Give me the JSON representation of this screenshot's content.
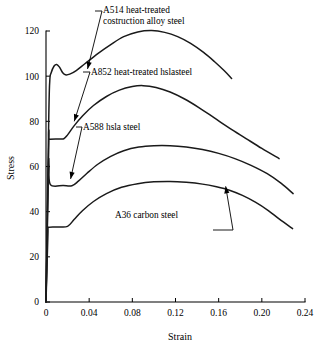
{
  "chart_data": {
    "type": "line",
    "title": "",
    "xlabel": "Strain",
    "ylabel": "Stress",
    "xlim": [
      0,
      0.24
    ],
    "ylim": [
      0,
      120
    ],
    "xticks": [
      "0",
      "0.04",
      "0.08",
      "0.12",
      "0.16",
      "0.20",
      "0.24"
    ],
    "xtick_values": [
      0,
      0.04,
      0.08,
      0.12,
      0.16,
      0.2,
      0.24
    ],
    "yticks": [
      "0",
      "20",
      "40",
      "60",
      "80",
      "100",
      "120"
    ],
    "ytick_values": [
      0,
      20,
      40,
      60,
      80,
      100,
      120
    ],
    "grid": false,
    "legend": "inline-annotations",
    "series": [
      {
        "name": "A514 heat-treated costruction alloy steel",
        "points": [
          [
            0.0,
            0.0
          ],
          [
            0.0025,
            80.0
          ],
          [
            0.0035,
            98.0
          ],
          [
            0.0048,
            101.5
          ],
          [
            0.0075,
            104.5
          ],
          [
            0.01,
            105.2
          ],
          [
            0.0125,
            104.0
          ],
          [
            0.0155,
            101.5
          ],
          [
            0.018,
            100.6
          ],
          [
            0.022,
            100.9
          ],
          [
            0.028,
            102.5
          ],
          [
            0.036,
            105.5
          ],
          [
            0.048,
            110.0
          ],
          [
            0.06,
            114.0
          ],
          [
            0.072,
            117.5
          ],
          [
            0.085,
            119.6
          ],
          [
            0.098,
            120.2
          ],
          [
            0.11,
            119.4
          ],
          [
            0.122,
            117.5
          ],
          [
            0.134,
            114.5
          ],
          [
            0.146,
            110.5
          ],
          [
            0.156,
            106.5
          ],
          [
            0.165,
            102.5
          ],
          [
            0.172,
            99.0
          ]
        ]
      },
      {
        "name": "A852 heat-treated hslasteel",
        "points": [
          [
            0.0,
            0.0
          ],
          [
            0.0026,
            70.5
          ],
          [
            0.0032,
            72.0
          ],
          [
            0.012,
            72.2
          ],
          [
            0.0165,
            72.3
          ],
          [
            0.02,
            74.0
          ],
          [
            0.026,
            78.0
          ],
          [
            0.034,
            82.5
          ],
          [
            0.044,
            87.0
          ],
          [
            0.056,
            91.0
          ],
          [
            0.068,
            93.8
          ],
          [
            0.08,
            95.4
          ],
          [
            0.09,
            95.8
          ],
          [
            0.102,
            95.0
          ],
          [
            0.115,
            93.0
          ],
          [
            0.128,
            90.0
          ],
          [
            0.142,
            86.0
          ],
          [
            0.156,
            81.5
          ],
          [
            0.17,
            77.0
          ],
          [
            0.185,
            72.5
          ],
          [
            0.2,
            68.0
          ],
          [
            0.216,
            63.5
          ]
        ]
      },
      {
        "name": "A588 hsla steel",
        "points": [
          [
            0.0,
            0.0
          ],
          [
            0.0022,
            58.0
          ],
          [
            0.0028,
            60.5
          ],
          [
            0.004,
            52.0
          ],
          [
            0.016,
            51.6
          ],
          [
            0.024,
            51.5
          ],
          [
            0.03,
            53.5
          ],
          [
            0.038,
            57.0
          ],
          [
            0.048,
            61.0
          ],
          [
            0.06,
            64.5
          ],
          [
            0.072,
            67.0
          ],
          [
            0.086,
            68.6
          ],
          [
            0.1,
            69.2
          ],
          [
            0.115,
            69.2
          ],
          [
            0.13,
            68.6
          ],
          [
            0.145,
            67.5
          ],
          [
            0.16,
            65.8
          ],
          [
            0.175,
            63.5
          ],
          [
            0.19,
            60.5
          ],
          [
            0.205,
            56.8
          ],
          [
            0.218,
            52.5
          ],
          [
            0.229,
            48.0
          ]
        ]
      },
      {
        "name": "A36 carbon steel",
        "points": [
          [
            0.0,
            0.0
          ],
          [
            0.0018,
            30.0
          ],
          [
            0.0024,
            33.0
          ],
          [
            0.012,
            33.2
          ],
          [
            0.02,
            33.5
          ],
          [
            0.026,
            36.5
          ],
          [
            0.034,
            40.5
          ],
          [
            0.044,
            44.5
          ],
          [
            0.056,
            48.0
          ],
          [
            0.07,
            50.8
          ],
          [
            0.085,
            52.4
          ],
          [
            0.1,
            53.2
          ],
          [
            0.115,
            53.4
          ],
          [
            0.13,
            53.0
          ],
          [
            0.145,
            52.2
          ],
          [
            0.158,
            51.0
          ],
          [
            0.17,
            49.5
          ],
          [
            0.182,
            47.2
          ],
          [
            0.194,
            44.2
          ],
          [
            0.206,
            40.5
          ],
          [
            0.216,
            36.8
          ],
          [
            0.2285,
            32.5
          ]
        ]
      }
    ],
    "annotations": [
      {
        "id": "a514",
        "lines": [
          "A514 heat-treated",
          "costruction alloy steel"
        ],
        "points_to": [
          0.038,
          104.0
        ]
      },
      {
        "id": "a852",
        "lines": [
          "A852 heat-treated hslasteel"
        ],
        "points_to": [
          0.0255,
          78.0
        ]
      },
      {
        "id": "a588",
        "lines": [
          "A588 hsla steel"
        ],
        "points_to": [
          0.0235,
          53.0
        ]
      },
      {
        "id": "a36",
        "lines": [
          "A36 carbon steel"
        ],
        "points_to": [
          0.1665,
          50.3
        ]
      }
    ]
  },
  "axes": {
    "x_title": "Strain",
    "y_title": "Stress"
  },
  "colors": {
    "curve": "#1a1a1a",
    "axis": "#000000",
    "background": "#ffffff"
  }
}
